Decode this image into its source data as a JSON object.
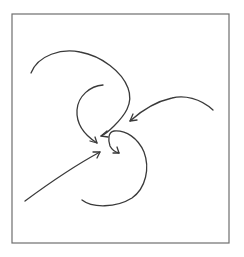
{
  "diagram": {
    "title": "",
    "stroke_color": "#3a3a3a",
    "frame_color": "#6e6e6e",
    "background": "#ffffff",
    "frame": {
      "x": 12,
      "y": 14,
      "width": 217,
      "height": 229
    },
    "arrows": [
      {
        "id": "outer-top-left-arc",
        "shape": "large S-curve from top-left",
        "end": [
          100,
          137
        ]
      },
      {
        "id": "inner-arc",
        "shape": "small arc from upper center",
        "end": [
          97,
          143
        ]
      },
      {
        "id": "right-arc",
        "shape": "arc from right side",
        "end": [
          130,
          121
        ]
      },
      {
        "id": "lower-left-line",
        "shape": "near-straight line from lower-left",
        "end": [
          100,
          152
        ]
      },
      {
        "id": "bottom-hook",
        "shape": "hook curve from bottom",
        "end": [
          119,
          153
        ]
      }
    ],
    "labels": []
  }
}
